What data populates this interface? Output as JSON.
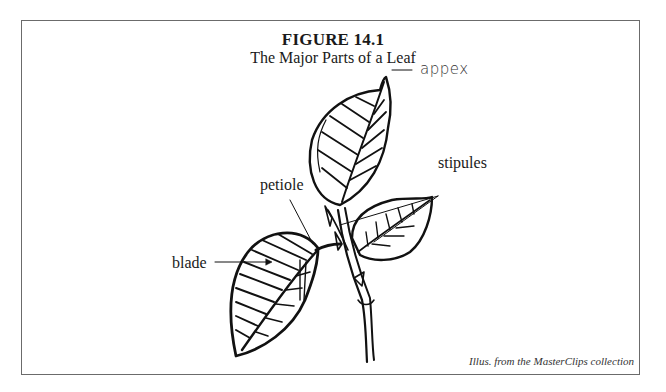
{
  "figure": {
    "title": "FIGURE 14.1",
    "subtitle": "The Major Parts of a Leaf",
    "credit": "Illus. from the MasterClips collection"
  },
  "labels": {
    "apex": "appex",
    "stipules": "stipules",
    "petiole": "petiole",
    "blade": "blade"
  },
  "colors": {
    "ink": "#111111",
    "frame": "#6b6b6b",
    "background": "#ffffff"
  }
}
